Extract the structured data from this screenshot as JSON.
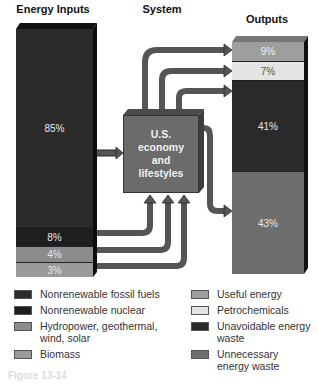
{
  "headers": {
    "inputs": "Energy Inputs",
    "system": "System",
    "outputs": "Outputs"
  },
  "system_box": {
    "line1": "U.S.",
    "line2": "economy",
    "line3": "and",
    "line4": "lifestyles"
  },
  "inputs": [
    {
      "label": "85%",
      "category": "Nonrenewable fossil fuels",
      "color": "#2b2b2b"
    },
    {
      "label": "8%",
      "category": "Nonrenewable nuclear",
      "color": "#1e1e1e"
    },
    {
      "label": "4%",
      "category": "Hydropower, geothermal, wind, solar",
      "color": "#8c8c8c"
    },
    {
      "label": "3%",
      "category": "Biomass",
      "color": "#9a9a9a"
    }
  ],
  "outputs": [
    {
      "label": "9%",
      "category": "Useful energy",
      "color": "#9e9e9e"
    },
    {
      "label": "7%",
      "category": "Petrochemicals",
      "color": "#e4e4e4"
    },
    {
      "label": "41%",
      "category": "Unavoidable energy waste",
      "color": "#2a2a2a"
    },
    {
      "label": "43%",
      "category": "Unnecessary energy waste",
      "color": "#6e6e6e"
    }
  ],
  "legend": {
    "left": [
      {
        "label": "Nonrenewable fossil fuels",
        "color": "#2b2b2b"
      },
      {
        "label": "Nonrenewable nuclear",
        "color": "#1e1e1e"
      },
      {
        "label": "Hydropower, geothermal, wind, solar",
        "color": "#8c8c8c"
      },
      {
        "label": "Biomass",
        "color": "#9a9a9a"
      }
    ],
    "right": [
      {
        "label": "Useful energy",
        "color": "#9e9e9e"
      },
      {
        "label": "Petrochemicals",
        "color": "#e4e4e4"
      },
      {
        "label": "Unavoidable energy waste",
        "color": "#2a2a2a"
      },
      {
        "label": "Unnecessary energy waste",
        "color": "#6e6e6e"
      }
    ]
  },
  "caption": "Figure 13-14"
}
